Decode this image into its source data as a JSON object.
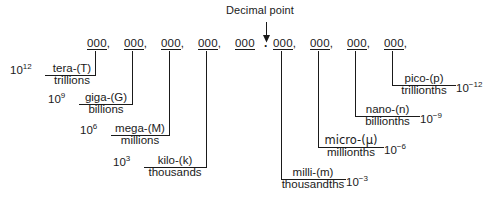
{
  "figure": {
    "decimal_point_label": "Decimal point",
    "arrow_icon": "down-arrow-icon",
    "line_color": "#1a1a1a",
    "background_color": "#ffffff"
  },
  "digit_groups": [
    {
      "id": "g1",
      "text": "000",
      "comma": ",",
      "x": 87
    },
    {
      "id": "g2",
      "text": "000",
      "comma": ",",
      "x": 125
    },
    {
      "id": "g3",
      "text": "000",
      "comma": ",",
      "x": 162
    },
    {
      "id": "g4",
      "text": "000",
      "comma": ",",
      "x": 199
    },
    {
      "id": "g5",
      "text": "000",
      "comma": "",
      "x": 237
    },
    {
      "id": "g6",
      "text": "000",
      "comma": ",",
      "x": 274
    },
    {
      "id": "g7",
      "text": "000",
      "comma": ",",
      "x": 311
    },
    {
      "id": "g8",
      "text": "000",
      "comma": ",",
      "x": 348
    },
    {
      "id": "g9",
      "text": "000",
      "comma": ",",
      "x": 385
    }
  ],
  "decimal_point": {
    "glyph": ".",
    "x": 266
  },
  "prefixes": [
    {
      "id": "tera",
      "power": "10",
      "exponent": "12",
      "exponent_sign": "positive",
      "prefix": "tera-(T)",
      "name": "trillions",
      "side": "left",
      "group": "g1"
    },
    {
      "id": "giga",
      "power": "10",
      "exponent": "9",
      "exponent_sign": "positive",
      "prefix": "giga-(G)",
      "name": "billions",
      "side": "left",
      "group": "g2"
    },
    {
      "id": "mega",
      "power": "10",
      "exponent": "6",
      "exponent_sign": "positive",
      "prefix": "mega-(M)",
      "name": "millions",
      "side": "left",
      "group": "g3"
    },
    {
      "id": "kilo",
      "power": "10",
      "exponent": "3",
      "exponent_sign": "positive",
      "prefix": "kilo-(k)",
      "name": "thousands",
      "side": "left",
      "group": "g4"
    },
    {
      "id": "milli",
      "power": "10",
      "exponent": "−3",
      "exponent_sign": "negative",
      "prefix": "milli-(m)",
      "name": "thousandths",
      "side": "right",
      "group": "g6"
    },
    {
      "id": "micro",
      "power": "10",
      "exponent": "−6",
      "exponent_sign": "negative",
      "prefix": "micro-(μ)",
      "name": "millionths",
      "side": "right",
      "group": "g7"
    },
    {
      "id": "nano",
      "power": "10",
      "exponent": "−9",
      "exponent_sign": "negative",
      "prefix": "nano-(n)",
      "name": "billionths",
      "side": "right",
      "group": "g8"
    },
    {
      "id": "pico",
      "power": "10",
      "exponent": "−12",
      "exponent_sign": "negative",
      "prefix": "pico-(p)",
      "name": "trillionths",
      "side": "right",
      "group": "g9"
    }
  ]
}
